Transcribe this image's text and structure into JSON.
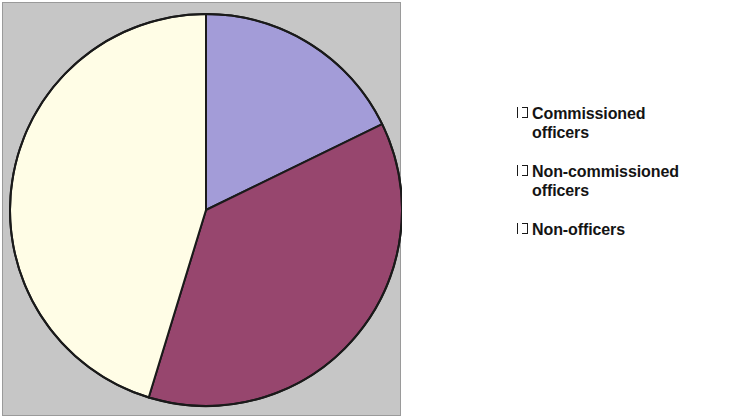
{
  "chart_data": {
    "type": "pie",
    "title": "",
    "subtitle": "",
    "xlabel": "",
    "ylabel": "",
    "grid": false,
    "legend_position": "right",
    "start_angle_deg": 0,
    "direction": "clockwise",
    "categories": [
      "Commissioned officers",
      "Non-commissioned officers",
      "Non-officers"
    ],
    "values": [
      18,
      37,
      45
    ],
    "value_unit": "percent",
    "slices": [
      {
        "label": "Commissioned officers",
        "label_lines": "Commissioned\nofficers",
        "value": 18,
        "start_angle_deg": 0,
        "end_angle_deg": 64,
        "color": "#a39cd8",
        "swatch_name": "legend-swatch-commissioned"
      },
      {
        "label": "Non-commissioned officers",
        "label_lines": "Non-commissioned\nofficers",
        "value": 37,
        "start_angle_deg": 64,
        "end_angle_deg": 197,
        "color": "#97466e",
        "swatch_name": "legend-swatch-non-commissioned"
      },
      {
        "label": "Non-officers",
        "label_lines": "Non-officers",
        "value": 45,
        "start_angle_deg": 197,
        "end_angle_deg": 360,
        "color": "#fffde6",
        "swatch_name": "legend-swatch-non-officers"
      }
    ],
    "geometry": {
      "center_x": 203,
      "center_y": 207,
      "radius": 196,
      "outline_color": "#1a1a1a",
      "outline_width": 2
    },
    "colors": {
      "plot_background": "#c6c6c6",
      "plot_border": "#9a9a9a",
      "figure_background": "#ffffff",
      "text": "#141414"
    }
  }
}
